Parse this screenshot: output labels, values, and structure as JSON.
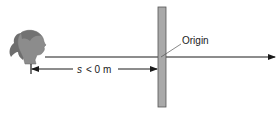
{
  "diagram": {
    "origin_label": "Origin",
    "measure": {
      "variable": "s",
      "relation": "< 0 m"
    },
    "icons": {
      "observer": "person-head-profile-icon",
      "reference": "vertical-pole-icon"
    },
    "colors": {
      "line": "#1a1a1a",
      "pole_fill": "#a9a9a9",
      "pole_stroke": "#555555",
      "head_fill": "#8a8a8a",
      "hair_fill": "#6e6e6e"
    }
  }
}
